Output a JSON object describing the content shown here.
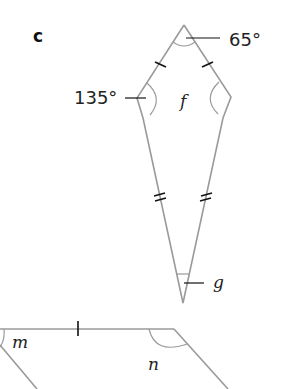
{
  "part_label": "c",
  "kite": {
    "angles": {
      "top": "65°",
      "left": "135°",
      "right": "f",
      "bottom": "g"
    },
    "markings": {
      "upper_sides": "single tick (equal)",
      "lower_sides": "double tick (equal)"
    }
  },
  "parallelogram": {
    "angles": {
      "top_left": "m",
      "top_right": "n"
    },
    "markings": {
      "top_side": "single tick"
    }
  }
}
